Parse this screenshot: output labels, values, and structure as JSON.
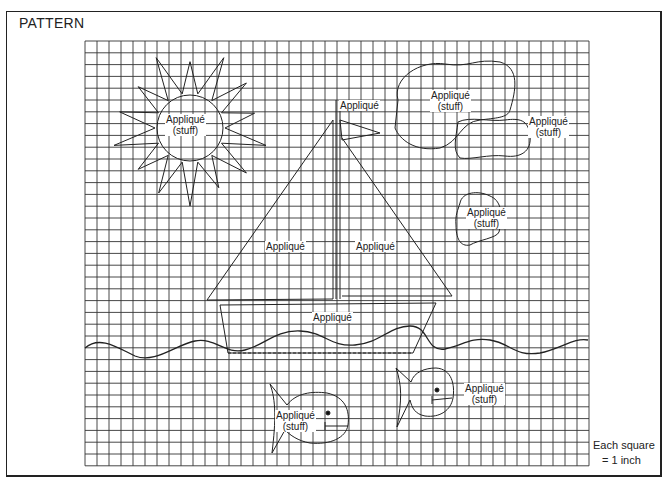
{
  "title": "PATTERN",
  "grid": {
    "left": 85,
    "top": 41,
    "cols": 42,
    "rows": 36,
    "cell_w": 12,
    "cell_h": 11.8,
    "line_color": "#333333"
  },
  "labels": {
    "sun": [
      "Appliqué",
      "(stuff)"
    ],
    "flag": "Appliqué",
    "cloud_large": [
      "Appliqué",
      "(stuff)"
    ],
    "cloud_small": [
      "Appliqué",
      "(stuff)"
    ],
    "cloud_single": [
      "Appliqué",
      "(stuff)"
    ],
    "sail_left": "Appliqué",
    "sail_right": "Appliqué",
    "hull": "Appliqué",
    "fish_left": [
      "Appliqué",
      "(stuff)"
    ],
    "fish_right": [
      "Appliqué",
      "(stuff)"
    ]
  },
  "scale_note": [
    "Each square",
    "= 1 inch"
  ]
}
